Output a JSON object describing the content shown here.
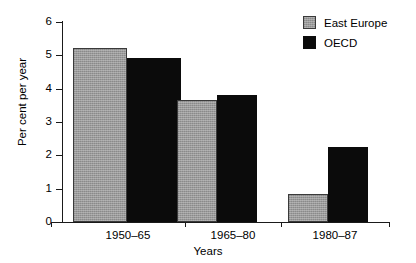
{
  "chart_data": {
    "type": "bar",
    "title": "",
    "xlabel": "Years",
    "ylabel": "Per cent per year",
    "categories": [
      "1950–65",
      "1965–80",
      "1980–87"
    ],
    "series": [
      {
        "name": "East Europe",
        "color": "#9a9a9a",
        "values": [
          5.22,
          3.65,
          0.85
        ]
      },
      {
        "name": "OECD",
        "color": "#0b0b0b",
        "values": [
          4.93,
          3.82,
          2.25
        ]
      }
    ],
    "ylim": [
      0,
      6
    ],
    "yticks": [
      "0",
      "1",
      "2",
      "3",
      "4",
      "5",
      "6"
    ],
    "grid": false,
    "legend_position": "top-right"
  },
  "axes": {
    "y_title": "Per cent per year",
    "x_title": "Years",
    "y_tick_labels": [
      "6",
      "5",
      "4",
      "3",
      "2",
      "1",
      "0"
    ],
    "x_tick_labels": [
      "1950–65",
      "1965–80",
      "1980–87"
    ]
  },
  "legend": {
    "items": [
      {
        "label": "East Europe",
        "swatch": "gray-swatch"
      },
      {
        "label": "OECD",
        "swatch": "black-swatch"
      }
    ]
  }
}
